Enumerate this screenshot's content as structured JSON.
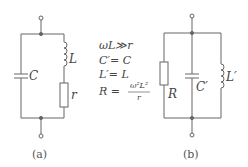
{
  "circuit_a": {
    "caption": "(a)",
    "components": [
      {
        "id": "C",
        "type": "capacitor",
        "label": "C"
      },
      {
        "id": "L",
        "type": "inductor",
        "label": "L"
      },
      {
        "id": "r",
        "type": "resistor",
        "label": "r"
      }
    ]
  },
  "circuit_b": {
    "caption": "(b)",
    "components": [
      {
        "id": "R",
        "type": "resistor",
        "label": "R"
      },
      {
        "id": "C'",
        "type": "capacitor",
        "label": "C′"
      },
      {
        "id": "L'",
        "type": "inductor",
        "label": "L′"
      }
    ]
  },
  "equations": {
    "line1": "ωL≫r",
    "line2": "C′= C",
    "line3": "L′= L",
    "line4_lhs": "R =",
    "line4_num": "ω²L²",
    "line4_den": "r"
  },
  "colors": {
    "wire": "#666666",
    "text": "#444444"
  }
}
